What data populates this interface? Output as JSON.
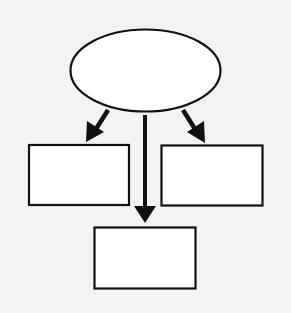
{
  "diagram": {
    "type": "hierarchy",
    "background": "#f3f3f3",
    "stroke_color": "#111111",
    "fill_color": "#ffffff",
    "nodes": [
      {
        "id": "root",
        "shape": "ellipse",
        "label": "",
        "cx": 145.5,
        "cy": 70.5,
        "rx": 75,
        "ry": 41
      },
      {
        "id": "left",
        "shape": "rect",
        "label": "",
        "x": 29,
        "y": 145,
        "w": 100,
        "h": 60
      },
      {
        "id": "right",
        "shape": "rect",
        "label": "",
        "x": 161.5,
        "y": 145.5,
        "w": 101,
        "h": 60
      },
      {
        "id": "bottom",
        "shape": "rect",
        "label": "",
        "x": 94.5,
        "y": 227.5,
        "w": 101,
        "h": 61
      }
    ],
    "edges": [
      {
        "from": "root",
        "to": "left",
        "x1": 108,
        "y1": 110,
        "x2": 88,
        "y2": 142
      },
      {
        "from": "root",
        "to": "right",
        "x1": 183,
        "y1": 110,
        "x2": 203,
        "y2": 142
      },
      {
        "from": "root",
        "to": "bottom",
        "x1": 145,
        "y1": 115,
        "x2": 145,
        "y2": 223
      }
    ]
  }
}
